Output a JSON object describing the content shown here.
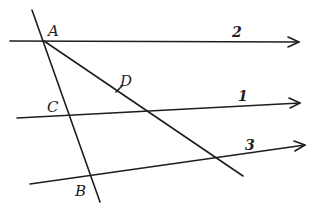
{
  "diagram": {
    "type": "geometry-construction",
    "background": "#ffffff",
    "stroke_color": "#1e1e1e",
    "points": [
      {
        "name": "A",
        "label": "A",
        "x": 44,
        "y": 41,
        "label_x": 48,
        "label_y": 36
      },
      {
        "name": "C",
        "label": "C",
        "x": 70,
        "y": 117,
        "label_x": 47,
        "label_y": 112
      },
      {
        "name": "B",
        "label": "B",
        "x": 91,
        "y": 177,
        "label_x": 75,
        "label_y": 196
      },
      {
        "name": "D",
        "label": "D",
        "x": 119,
        "y": 89,
        "label_x": 120,
        "label_y": 86
      }
    ],
    "rays": [
      {
        "id": "2",
        "label": "2",
        "x1": 10,
        "y1": 41,
        "x2": 299,
        "y2": 42,
        "label_x": 232,
        "label_y": 37
      },
      {
        "id": "1",
        "label": "1",
        "x1": 17,
        "y1": 118,
        "x2": 300,
        "y2": 103,
        "label_x": 238,
        "label_y": 101
      },
      {
        "id": "3",
        "label": "3",
        "x1": 30,
        "y1": 184,
        "x2": 305,
        "y2": 145,
        "label_x": 245,
        "label_y": 150
      }
    ],
    "segments": [
      {
        "id": "AB",
        "x1": 32,
        "y1": 10,
        "x2": 100,
        "y2": 202
      },
      {
        "id": "AD",
        "x1": 44,
        "y1": 41,
        "x2": 243,
        "y2": 176
      }
    ]
  }
}
